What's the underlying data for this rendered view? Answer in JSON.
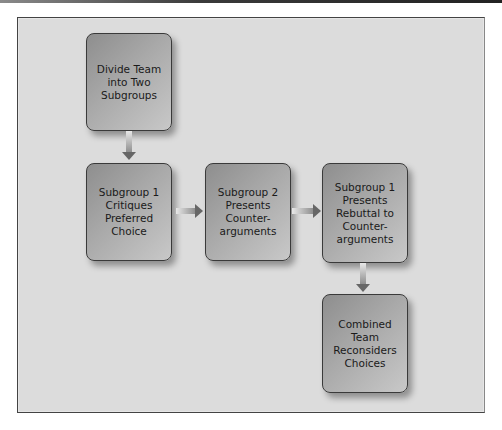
{
  "diagram": {
    "type": "flowchart",
    "nodes": [
      {
        "id": "n1",
        "label": "Divide Team into Two Subgroups"
      },
      {
        "id": "n2",
        "label": "Subgroup 1 Critiques Preferred Choice"
      },
      {
        "id": "n3",
        "label": "Subgroup 2 Presents Counter-arguments"
      },
      {
        "id": "n4",
        "label": "Subgroup 1 Presents Rebuttal to Counter-arguments"
      },
      {
        "id": "n5",
        "label": "Combined Team Reconsiders Choices"
      }
    ],
    "edges": [
      {
        "from": "n1",
        "to": "n2",
        "direction": "down"
      },
      {
        "from": "n2",
        "to": "n3",
        "direction": "right"
      },
      {
        "from": "n3",
        "to": "n4",
        "direction": "right"
      },
      {
        "from": "n4",
        "to": "n5",
        "direction": "down"
      }
    ]
  }
}
